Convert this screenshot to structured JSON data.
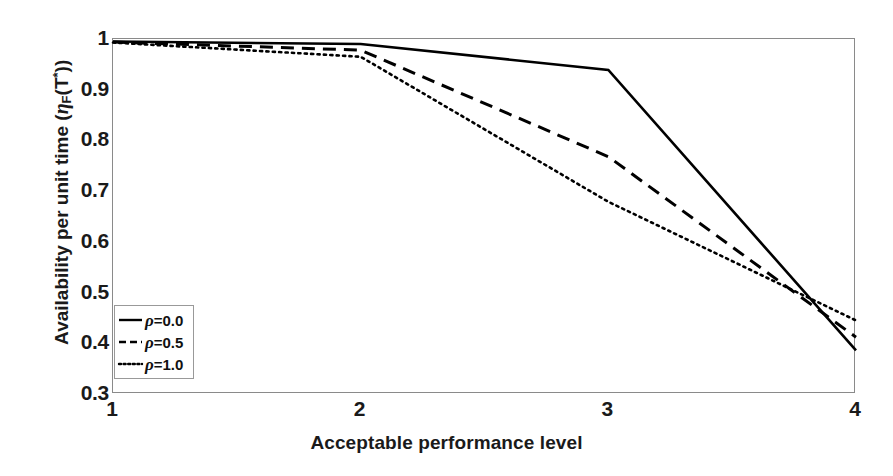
{
  "chart_data": {
    "type": "line",
    "title": "",
    "xlabel": "Acceptable performance level",
    "ylabel": "Availability per unit time (η_F(T*))",
    "ylabel_parts": {
      "prefix": "Availability per unit time (",
      "eta": "η",
      "sub": "F",
      "mid": "(T",
      "sup": "*",
      "suffix": "))"
    },
    "x": [
      1,
      2,
      3,
      4
    ],
    "xlim": [
      1,
      4
    ],
    "ylim": [
      0.3,
      1.0
    ],
    "xticks": [
      "1",
      "2",
      "3",
      "4"
    ],
    "yticks": [
      "1",
      "0.9",
      "0.8",
      "0.7",
      "0.6",
      "0.5",
      "0.4",
      "0.3"
    ],
    "ytick_values": [
      1.0,
      0.9,
      0.8,
      0.7,
      0.6,
      0.5,
      0.4,
      0.3
    ],
    "grid": false,
    "legend_position": "lower-left",
    "series": [
      {
        "name": "ρ=0.0",
        "rho": "0.0",
        "style": "solid",
        "color": "#000000",
        "values": [
          0.995,
          0.99,
          0.939,
          0.386
        ]
      },
      {
        "name": "ρ=0.5",
        "rho": "0.5",
        "style": "dashed",
        "color": "#000000",
        "values": [
          0.994,
          0.978,
          0.768,
          0.412
        ]
      },
      {
        "name": "ρ=1.0",
        "rho": "1.0",
        "style": "dotted",
        "color": "#000000",
        "values": [
          0.993,
          0.965,
          0.679,
          0.445
        ]
      }
    ]
  },
  "legend": {
    "items": [
      {
        "label": "ρ=0.0",
        "rho_value": "=0.0",
        "style": "solid"
      },
      {
        "label": "ρ=0.5",
        "rho_value": "=0.5",
        "style": "dashed"
      },
      {
        "label": "ρ=1.0",
        "rho_value": "=1.0",
        "style": "dotted"
      }
    ]
  },
  "axes": {
    "frame_color": "#8a8a8a",
    "tick_color": "#9a9a9a",
    "text_color": "#1a1a1a",
    "background": "#ffffff"
  }
}
